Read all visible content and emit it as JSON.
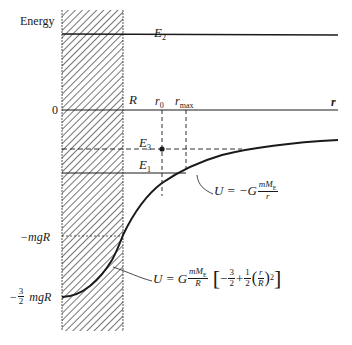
{
  "figure": {
    "y_axis_label": "Energy",
    "x_axis_label": "r",
    "region_label": "R",
    "levels": {
      "E2": {
        "name": "E",
        "sub": "2"
      },
      "E3": {
        "name": "E",
        "sub": "3"
      },
      "E1": {
        "name": "E",
        "sub": "1"
      }
    },
    "y_ticks": {
      "zero": "0",
      "neg_mgR": "−mgR",
      "neg_three_halves_minus": "−",
      "three": "3",
      "two": "2",
      "mgR": "mgR"
    },
    "r_markers": {
      "r0": {
        "name": "r",
        "sub": "0"
      },
      "rmax": {
        "name": "r",
        "sub": "max"
      }
    },
    "outside_formula": {
      "lhs": "U = −G",
      "num": "mM",
      "num_sub": "E",
      "den": "r"
    },
    "inside_formula": {
      "lhs": "U = G",
      "num": "mM",
      "num_sub": "E",
      "den": "R",
      "bracket_open": "[",
      "minus": "−",
      "f1_num": "3",
      "f1_den": "2",
      "plus": "+",
      "f2_num": "1",
      "f2_den": "2",
      "paren_open": "(",
      "f3_num": "r",
      "f3_den": "R",
      "paren_close": ")",
      "exponent": "2",
      "bracket_close": "]"
    },
    "colors": {
      "ink": "#1a1a1a",
      "background": "#ffffff"
    }
  }
}
